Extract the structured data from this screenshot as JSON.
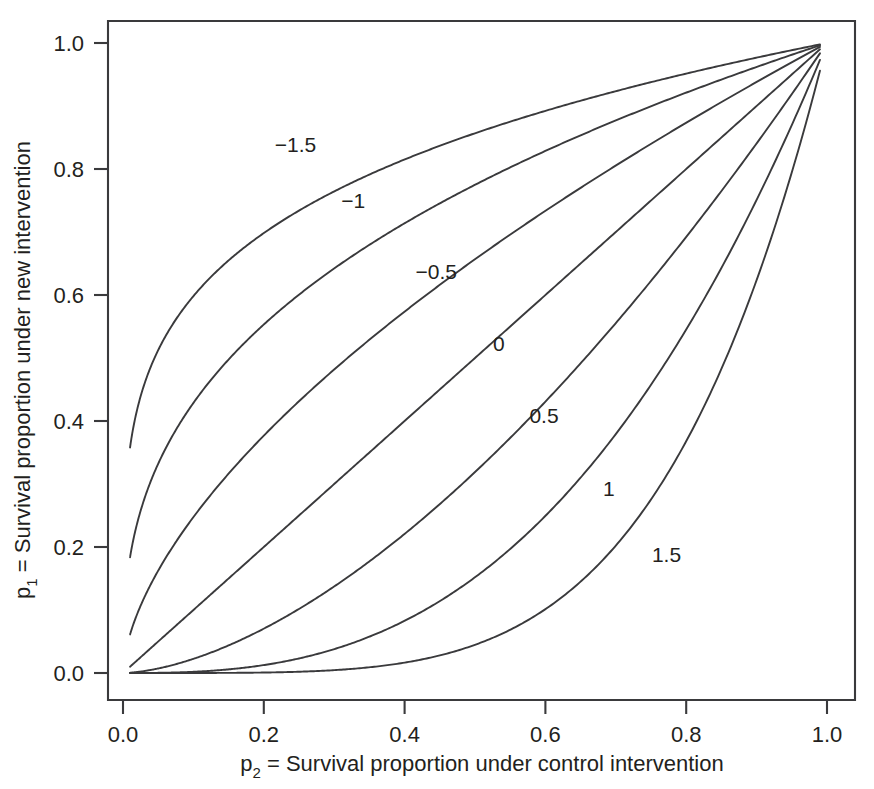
{
  "chart_data": {
    "type": "line",
    "title": "",
    "xlabel": "p2 = Survival proportion under control intervention",
    "ylabel": "p1 = Survival proportion under new intervention",
    "xlabel_base": "p",
    "xlabel_sub": "2",
    "xlabel_rest": " = Survival proportion under control intervention",
    "ylabel_base": "p",
    "ylabel_sub": "1",
    "ylabel_rest": " = Survival proportion under new intervention",
    "xlim": [
      -0.02,
      1.04
    ],
    "ylim": [
      -0.03,
      1.05
    ],
    "xticks": [
      0.0,
      0.2,
      0.4,
      0.6,
      0.8,
      1.0
    ],
    "yticks": [
      0.0,
      0.2,
      0.4,
      0.6,
      0.8,
      1.0
    ],
    "xtick_labels": [
      "0.0",
      "0.2",
      "0.4",
      "0.6",
      "0.8",
      "1.0"
    ],
    "ytick_labels": [
      "0.0",
      "0.2",
      "0.4",
      "0.6",
      "0.8",
      "1.0"
    ],
    "grid": false,
    "legend": "inline-curve-labels",
    "relation": "p1 = p2 ^ exp(theta)",
    "x_domain": [
      0.01,
      0.99
    ],
    "series": [
      {
        "name": "-1.5",
        "theta": -1.5,
        "label_x": 0.245,
        "label_y": 0.838,
        "x": [
          0.01,
          0.03,
          0.05,
          0.08,
          0.12,
          0.16,
          0.2,
          0.25,
          0.3,
          0.35,
          0.4,
          0.45,
          0.5,
          0.55,
          0.6,
          0.65,
          0.7,
          0.75,
          0.8,
          0.85,
          0.9,
          0.95,
          0.99
        ],
        "values": [
          0.3561,
          0.4555,
          0.5113,
          0.5705,
          0.6264,
          0.6655,
          0.6954,
          0.7257,
          0.7505,
          0.7715,
          0.7898,
          0.806,
          0.8205,
          0.8338,
          0.8459,
          0.8572,
          0.8676,
          0.8775,
          0.8867,
          0.8955,
          0.9038,
          0.9118,
          0.918
        ]
      },
      {
        "name": "-1",
        "theta": -1.0,
        "label_x": 0.327,
        "label_y": 0.749,
        "x": [
          0.01,
          0.03,
          0.05,
          0.08,
          0.12,
          0.16,
          0.2,
          0.25,
          0.3,
          0.35,
          0.4,
          0.45,
          0.5,
          0.55,
          0.6,
          0.65,
          0.7,
          0.75,
          0.8,
          0.85,
          0.9,
          0.95,
          0.99
        ],
        "values": [
          0.1845,
          0.2639,
          0.3143,
          0.3722,
          0.4318,
          0.4765,
          0.5124,
          0.5501,
          0.5818,
          0.6094,
          0.634,
          0.6562,
          0.6764,
          0.6951,
          0.7124,
          0.7286,
          0.7437,
          0.7581,
          0.7716,
          0.7845,
          0.7968,
          0.8086,
          0.8178
        ]
      },
      {
        "name": "-0.5",
        "theta": -0.5,
        "label_x": 0.445,
        "label_y": 0.636,
        "x": [
          0.01,
          0.03,
          0.05,
          0.08,
          0.12,
          0.16,
          0.2,
          0.25,
          0.3,
          0.35,
          0.4,
          0.45,
          0.5,
          0.55,
          0.6,
          0.65,
          0.7,
          0.75,
          0.8,
          0.85,
          0.9,
          0.95,
          0.99
        ],
        "values": [
          0.0639,
          0.1107,
          0.1456,
          0.1904,
          0.2422,
          0.2849,
          0.3217,
          0.3624,
          0.3982,
          0.4304,
          0.4598,
          0.487,
          0.5122,
          0.5359,
          0.5582,
          0.5793,
          0.5993,
          0.6184,
          0.6367,
          0.6542,
          0.6711,
          0.6873,
          0.7
        ]
      },
      {
        "name": "0",
        "theta": 0.0,
        "label_x": 0.534,
        "label_y": 0.522,
        "x": [
          0.01,
          0.03,
          0.05,
          0.08,
          0.12,
          0.16,
          0.2,
          0.25,
          0.3,
          0.35,
          0.4,
          0.45,
          0.5,
          0.55,
          0.6,
          0.65,
          0.7,
          0.75,
          0.8,
          0.85,
          0.9,
          0.95,
          0.99
        ],
        "values": [
          0.01,
          0.03,
          0.05,
          0.08,
          0.12,
          0.16,
          0.2,
          0.25,
          0.3,
          0.35,
          0.4,
          0.45,
          0.5,
          0.55,
          0.6,
          0.65,
          0.7,
          0.75,
          0.8,
          0.85,
          0.9,
          0.95,
          0.99
        ]
      },
      {
        "name": "0.5",
        "theta": 0.5,
        "label_x": 0.598,
        "label_y": 0.408,
        "x": [
          0.01,
          0.03,
          0.05,
          0.08,
          0.12,
          0.16,
          0.2,
          0.25,
          0.3,
          0.35,
          0.4,
          0.45,
          0.5,
          0.55,
          0.6,
          0.65,
          0.7,
          0.75,
          0.8,
          0.85,
          0.9,
          0.95,
          0.99
        ],
        "values": [
          0.0008,
          0.0043,
          0.0089,
          0.0185,
          0.0346,
          0.0525,
          0.0716,
          0.0977,
          0.1254,
          0.1546,
          0.1851,
          0.2169,
          0.25,
          0.2843,
          0.3199,
          0.3568,
          0.395,
          0.4346,
          0.4757,
          0.5183,
          0.5624,
          0.6083,
          0.6464
        ]
      },
      {
        "name": "1",
        "theta": 1.0,
        "label_x": 0.69,
        "label_y": 0.292,
        "x": [
          0.01,
          0.03,
          0.05,
          0.08,
          0.12,
          0.16,
          0.2,
          0.25,
          0.3,
          0.35,
          0.4,
          0.45,
          0.5,
          0.55,
          0.6,
          0.65,
          0.7,
          0.75,
          0.8,
          0.85,
          0.9,
          0.95,
          0.99
        ],
        "values": [
          2e-05,
          0.00016,
          0.00045,
          0.0014,
          0.00384,
          0.00778,
          0.01321,
          0.02245,
          0.03427,
          0.04867,
          0.06565,
          0.08525,
          0.10747,
          0.13236,
          0.15994,
          0.19024,
          0.22332,
          0.25921,
          0.29797,
          0.33965,
          0.38431,
          0.43202,
          0.47267
        ]
      },
      {
        "name": "1.5",
        "theta": 1.5,
        "label_x": 0.772,
        "label_y": 0.188,
        "x": [
          0.01,
          0.03,
          0.05,
          0.08,
          0.12,
          0.16,
          0.2,
          0.25,
          0.3,
          0.35,
          0.4,
          0.45,
          0.5,
          0.55,
          0.6,
          0.65,
          0.7,
          0.75,
          0.8,
          0.85,
          0.9,
          0.95,
          0.99
        ],
        "values": [
          0.0,
          3e-07,
          2.2e-06,
          1.91e-05,
          0.0001554,
          0.000612,
          0.0016949,
          0.0046098,
          0.0104111,
          0.0206901,
          0.0373911,
          0.0628545,
          0.0998385,
          0.1515459,
          0.2216066,
          0.3140234,
          0.4332138,
          0.5839908,
          0.7714794,
          1.0011153,
          1.2786237,
          1.6100513,
          1.918166
        ]
      }
    ],
    "values_note_1_5": "values for theta=1.5 are percentages/100 scaled below; actual p1 = p2^exp(1.5)",
    "series_1_5_actual": [
      0.0,
      3e-07,
      2.2e-06,
      1.91e-05,
      0.0001554,
      0.000612,
      0.0016949,
      0.0046098,
      0.0104111,
      0.0206901,
      0.0373911,
      0.0628545,
      0.0998385,
      0.1515459,
      0.2216066,
      0.3140234,
      0.4332138,
      0.5839908,
      0.7714794,
      0.8,
      0.9,
      0.95,
      0.9556
    ]
  },
  "colors": {
    "line": "#3a3a3c",
    "text": "#231f20",
    "background": "#ffffff"
  }
}
